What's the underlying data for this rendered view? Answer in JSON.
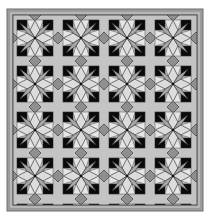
{
  "image": {
    "subject": "quilt-pattern",
    "description": "Square quilt with repeating eight-point star motif in greyscale",
    "grid": {
      "columns": 4,
      "rows": 4,
      "tile_size_px": 46
    },
    "frame": {
      "x": 7,
      "y": 9,
      "width": 196,
      "height": 202
    },
    "inner": {
      "x": 13,
      "y": 14,
      "width": 184,
      "height": 192
    }
  },
  "colors": {
    "background": "#ffffff",
    "border_outer": "#6e6e6e",
    "border_band": "#9c9c9c",
    "border_inner": "#c8c8c8",
    "petal_light": "#dcdcdc",
    "petal_mid": "#a8a8a8",
    "diamond": "#8f8f8f",
    "square": "#0a0a0a",
    "field": "#c4c4c4",
    "line": "#2a2a2a"
  }
}
